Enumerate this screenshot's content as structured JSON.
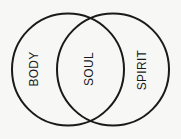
{
  "diagram": {
    "type": "venn",
    "background": "#f7f7f6",
    "stroke_color": "#1a1a1a",
    "circles": [
      {
        "name": "left",
        "cx": 68,
        "cy": 69,
        "r": 56
      },
      {
        "name": "right",
        "cx": 113,
        "cy": 69,
        "r": 56
      }
    ],
    "labels": {
      "left": "BODY",
      "center": "SOUL",
      "right": "SPIRIT"
    }
  }
}
